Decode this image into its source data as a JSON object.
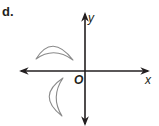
{
  "figure": {
    "part_label": "d.",
    "x_axis_label": "x",
    "y_axis_label": "y",
    "origin_label": "O",
    "colors": {
      "axis": "#231f20",
      "shape_stroke": "#8a8a8a"
    },
    "shapes": [
      {
        "name": "crescent-upper",
        "quadrant": "II",
        "orientation": "opening downward"
      },
      {
        "name": "crescent-lower",
        "quadrant": "III",
        "orientation": "opening rightward"
      }
    ]
  }
}
